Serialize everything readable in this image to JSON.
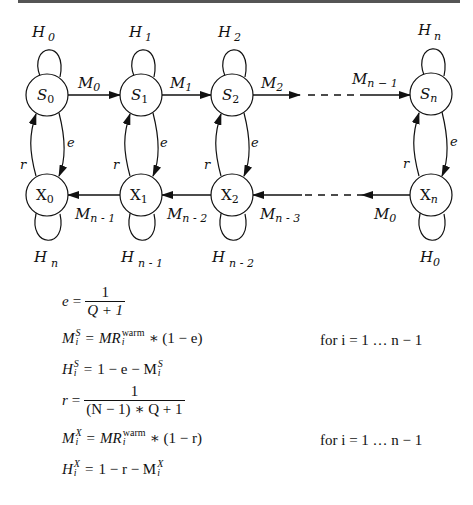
{
  "diagram": {
    "top_row_states": [
      {
        "name": "S",
        "sub": "0",
        "loop_label": "H",
        "loop_sub": "0"
      },
      {
        "name": "S",
        "sub": "1",
        "loop_label": "H",
        "loop_sub": "1"
      },
      {
        "name": "S",
        "sub": "2",
        "loop_label": "H",
        "loop_sub": "2"
      },
      {
        "name": "S",
        "sub": "n",
        "loop_label": "H",
        "loop_sub": "n"
      }
    ],
    "bottom_row_states": [
      {
        "name": "X",
        "sub": "0",
        "loop_label": "H",
        "loop_sub": "n"
      },
      {
        "name": "X",
        "sub": "1",
        "loop_label": "H",
        "loop_sub": "n - 1"
      },
      {
        "name": "X",
        "sub": "2",
        "loop_label": "H",
        "loop_sub": "n - 2"
      },
      {
        "name": "X",
        "sub": "n",
        "loop_label": "H",
        "loop_sub": "0"
      }
    ],
    "top_edges": [
      {
        "label": "M",
        "sub": "0"
      },
      {
        "label": "M",
        "sub": "1"
      },
      {
        "label": "M",
        "sub": "2"
      },
      {
        "label": "M",
        "sub": "n − 1"
      }
    ],
    "bottom_edges": [
      {
        "label": "M",
        "sub": "n - 1"
      },
      {
        "label": "M",
        "sub": "n - 2"
      },
      {
        "label": "M",
        "sub": "n - 3"
      },
      {
        "label": "M",
        "sub": "0"
      }
    ],
    "down_edge_label": "e",
    "up_edge_label": "r"
  },
  "equations": {
    "e": {
      "lhs": "e",
      "eq": "=",
      "num": "1",
      "den": "Q + 1"
    },
    "ms": {
      "lhs": "M",
      "sup": "S",
      "sub": "i",
      "rhs_pre": "MR",
      "rhs_sup": "warm",
      "rhs_sub": "i",
      "rhs_post": "∗ (1 − e)",
      "cond": "for i = 1 … n − 1"
    },
    "hs": {
      "lhs": "H",
      "sup": "S",
      "sub": "i",
      "rhs_pre": "1 − e − M",
      "rhs_sup": "S",
      "rhs_sub": "i"
    },
    "r": {
      "lhs": "r",
      "eq": "=",
      "num": "1",
      "den": "(N − 1) ∗ Q + 1"
    },
    "mx": {
      "lhs": "M",
      "sup": "X",
      "sub": "i",
      "rhs_pre": "MR",
      "rhs_sup": "warm",
      "rhs_sub": "i",
      "rhs_post": "∗ (1 − r)",
      "cond": "for i = 1 … n − 1"
    },
    "hx": {
      "lhs": "H",
      "sup": "X",
      "sub": "i",
      "rhs_pre": "1 − r − M",
      "rhs_sup": "X",
      "rhs_sub": "i"
    }
  }
}
